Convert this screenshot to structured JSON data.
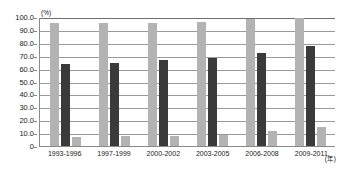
{
  "chart_data": {
    "type": "bar",
    "title": "",
    "xlabel": "(年)",
    "ylabel": "(%)",
    "ylim": [
      0,
      100
    ],
    "ytick_labels": [
      "100.0",
      "90.0",
      "80.0",
      "70.0",
      "60.0",
      "50.0",
      "40.0",
      "30.0",
      "20.0",
      "10.0",
      "0"
    ],
    "ytick_values": [
      100,
      90,
      80,
      70,
      60,
      50,
      40,
      30,
      20,
      10,
      0
    ],
    "grid": true,
    "legend": "none",
    "categories": [
      "1993-1996",
      "1997-1999",
      "2000-2002",
      "2003-2005",
      "2006-2008",
      "2009-2011"
    ],
    "series": [
      {
        "name": "series-1",
        "color": "#b3b3b3",
        "values": [
          95.5,
          95.0,
          95.0,
          96.0,
          98.5,
          99.5
        ]
      },
      {
        "name": "series-2",
        "color": "#3a3a3a",
        "values": [
          63.5,
          64.0,
          66.5,
          68.0,
          72.0,
          77.5
        ]
      },
      {
        "name": "series-3",
        "color": "#b3b3b3",
        "values": [
          7.0,
          8.0,
          8.0,
          8.5,
          12.0,
          15.0
        ]
      }
    ]
  },
  "axis": {
    "y_unit": "(%)",
    "x_unit": "(年)"
  },
  "title_remnant": ""
}
